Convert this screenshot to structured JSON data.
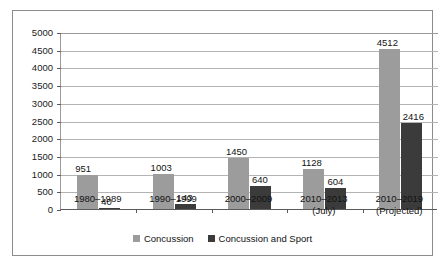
{
  "chart_data": {
    "type": "bar",
    "title": "",
    "xlabel": "",
    "ylabel": "",
    "ylim": [
      0,
      5000
    ],
    "ytick_step": 500,
    "yticks": [
      "0",
      "500",
      "1000",
      "1500",
      "2000",
      "2500",
      "3000",
      "3500",
      "4000",
      "4500",
      "5000"
    ],
    "grid": true,
    "legend_position": "bottom-center",
    "categories": [
      {
        "line1": "1980–1989",
        "line2": ""
      },
      {
        "line1": "1990–1999",
        "line2": ""
      },
      {
        "line1": "2000–2009",
        "line2": ""
      },
      {
        "line1": "2010–2013",
        "line2": "(July)"
      },
      {
        "line1": "2010–2019",
        "line2": "(Projected)"
      }
    ],
    "series": [
      {
        "name": "Concussion",
        "color": "#9c9c9c",
        "values": [
          951,
          1003,
          1450,
          1128,
          4512
        ],
        "labels": [
          "951",
          "1003",
          "1450",
          "1128",
          "4512"
        ]
      },
      {
        "name": "Concussion and Sport",
        "color": "#3b3b3b",
        "values": [
          40,
          143,
          640,
          604,
          2416
        ],
        "labels": [
          "40",
          "143",
          "640",
          "604",
          "2416"
        ]
      }
    ]
  },
  "legend": {
    "items": [
      {
        "label": "Concussion",
        "swatch": "legend-swatch-concussion"
      },
      {
        "label": "Concussion and Sport",
        "swatch": "legend-swatch-concussion-and-sport"
      }
    ]
  },
  "caption": {
    "text": ""
  }
}
